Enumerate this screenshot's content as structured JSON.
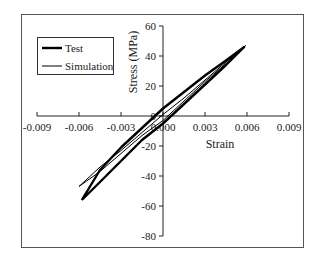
{
  "chart_data": {
    "type": "line",
    "title": "",
    "xlabel": "Strain",
    "ylabel": "Stress (MPa)",
    "xlim": [
      -0.009,
      0.009
    ],
    "ylim": [
      -80,
      60
    ],
    "x_ticks": [
      -0.009,
      -0.006,
      -0.003,
      0.0,
      0.003,
      0.006,
      0.009
    ],
    "x_tick_labels": [
      "-0.009",
      "-0.006",
      "-0.003",
      "0.000",
      "0.003",
      "0.006",
      "0.009"
    ],
    "y_ticks": [
      60,
      40,
      20,
      0,
      -20,
      -40,
      -60,
      -80
    ],
    "y_tick_labels": [
      "60",
      "40",
      "20",
      "0",
      "-20",
      "-40",
      "-60",
      "-80"
    ],
    "grid": false,
    "legend_position": "upper-left",
    "series": [
      {
        "name": "Test",
        "style": "thick",
        "color": "#000000",
        "points": [
          [
            -0.0058,
            -56
          ],
          [
            -0.0045,
            -44
          ],
          [
            -0.003,
            -30
          ],
          [
            -0.0015,
            -16
          ],
          [
            0.0,
            -5
          ],
          [
            0.0015,
            8
          ],
          [
            0.003,
            21
          ],
          [
            0.0045,
            34
          ],
          [
            0.0058,
            46
          ],
          [
            0.0045,
            37
          ],
          [
            0.003,
            27
          ],
          [
            0.0015,
            16
          ],
          [
            0.0,
            5
          ],
          [
            -0.0015,
            -8
          ],
          [
            -0.003,
            -21
          ],
          [
            -0.0045,
            -36
          ],
          [
            -0.0058,
            -56
          ]
        ]
      },
      {
        "name": "Simulation",
        "style": "thin",
        "color": "#000000",
        "points": [
          [
            -0.006,
            -47
          ],
          [
            -0.0045,
            -37
          ],
          [
            -0.003,
            -25
          ],
          [
            -0.0015,
            -13
          ],
          [
            0.0,
            -3
          ],
          [
            0.0015,
            10
          ],
          [
            0.003,
            23
          ],
          [
            0.0045,
            35
          ],
          [
            0.0059,
            47
          ],
          [
            0.0045,
            36
          ],
          [
            0.003,
            24
          ],
          [
            0.0015,
            12
          ],
          [
            0.0,
            1
          ],
          [
            -0.0015,
            -11
          ],
          [
            -0.003,
            -23
          ],
          [
            -0.0045,
            -34
          ],
          [
            -0.006,
            -47
          ]
        ]
      }
    ]
  },
  "legend": {
    "items": [
      {
        "label": "Test",
        "stroke_width": 2.4
      },
      {
        "label": "Simulation",
        "stroke_width": 1
      }
    ]
  }
}
